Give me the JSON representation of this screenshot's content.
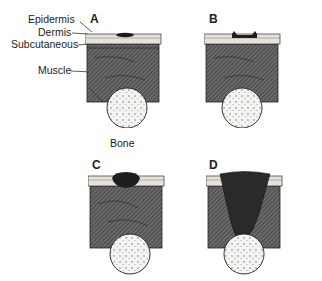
{
  "labels": {
    "epidermis": "Epidermis",
    "dermis": "Dermis",
    "subcutaneous": "Subcutaneous",
    "muscle": "Muscle",
    "bone": "Bone"
  },
  "panels": [
    {
      "letter": "A",
      "stage": "epidermis-only"
    },
    {
      "letter": "B",
      "stage": "dermis"
    },
    {
      "letter": "C",
      "stage": "subcutaneous"
    },
    {
      "letter": "D",
      "stage": "muscle-to-bone"
    }
  ],
  "colors": {
    "muscle": "#555555",
    "skin": "#e6e2da",
    "bone": "#f2f2ee",
    "wound": "#1e1e1e"
  }
}
